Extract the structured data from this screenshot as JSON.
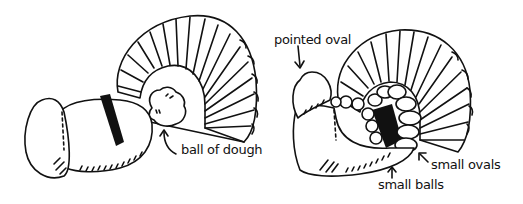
{
  "illustration": {
    "panels": [
      {
        "id": "step-1",
        "labels": [
          {
            "text": "ball of dough",
            "x": 181,
            "y": 150
          }
        ]
      },
      {
        "id": "step-2",
        "labels": [
          {
            "text": "pointed oval",
            "x": 274,
            "y": 36
          },
          {
            "text": "small ovals",
            "x": 430,
            "y": 164
          },
          {
            "text": "small balls",
            "x": 378,
            "y": 184
          }
        ]
      }
    ],
    "colors": {
      "ink": "#111111",
      "background": "#ffffff"
    }
  }
}
